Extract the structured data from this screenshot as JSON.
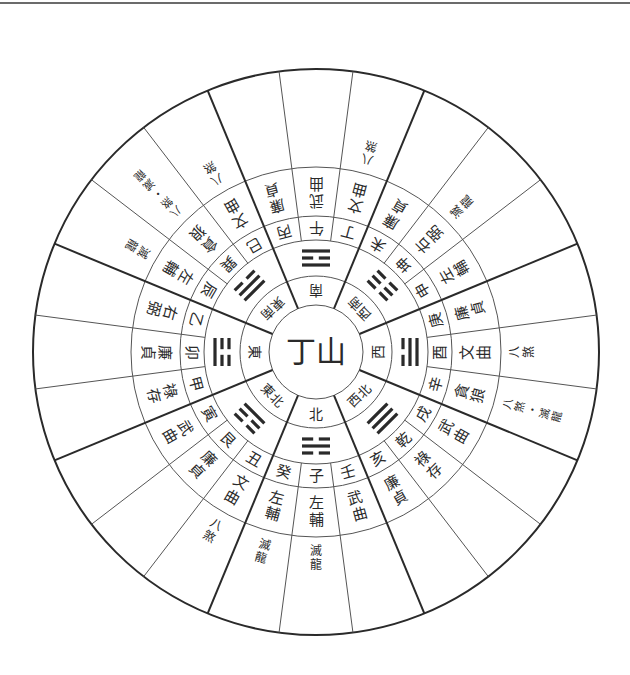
{
  "title": "丁山",
  "layout": {
    "cx": 316,
    "cy": 352,
    "radii": {
      "outer": 283,
      "star_outer": 185,
      "mountain_outer": 136,
      "trigram_outer": 112,
      "direction_outer": 76,
      "center": 47
    }
  },
  "center_label": "丁山",
  "directions": [
    {
      "name": "南",
      "trigram": "離",
      "lines": [
        1,
        0,
        1
      ]
    },
    {
      "name": "西南",
      "trigram": "坤",
      "lines": [
        0,
        0,
        0
      ]
    },
    {
      "name": "西",
      "trigram": "兌",
      "lines": [
        0,
        1,
        1
      ]
    },
    {
      "name": "西北",
      "trigram": "乾",
      "lines": [
        1,
        1,
        1
      ]
    },
    {
      "name": "北",
      "trigram": "坎",
      "lines": [
        0,
        1,
        0
      ]
    },
    {
      "name": "東北",
      "trigram": "艮",
      "lines": [
        1,
        0,
        0
      ]
    },
    {
      "name": "東",
      "trigram": "震",
      "lines": [
        0,
        0,
        1
      ]
    },
    {
      "name": "東南",
      "trigram": "巽",
      "lines": [
        1,
        1,
        0
      ]
    }
  ],
  "mountains": [
    {
      "mountain": "午",
      "star": "武曲",
      "outer": ""
    },
    {
      "mountain": "丁",
      "star": "文曲",
      "outer": "八煞"
    },
    {
      "mountain": "未",
      "star": "廉貞",
      "outer": ""
    },
    {
      "mountain": "坤",
      "star": "右弼",
      "outer": "滅龍"
    },
    {
      "mountain": "申",
      "star": "左輔",
      "outer": ""
    },
    {
      "mountain": "庚",
      "star": "廉貞",
      "outer": ""
    },
    {
      "mountain": "酉",
      "star": "文曲",
      "outer": "八煞"
    },
    {
      "mountain": "辛",
      "star": "貪狼",
      "outer": "八煞・滅龍"
    },
    {
      "mountain": "戌",
      "star": "武曲",
      "outer": ""
    },
    {
      "mountain": "乾",
      "star": "祿存",
      "outer": ""
    },
    {
      "mountain": "亥",
      "star": "廉貞",
      "outer": ""
    },
    {
      "mountain": "壬",
      "star": "武曲",
      "outer": ""
    },
    {
      "mountain": "子",
      "star": "左輔",
      "outer": "滅龍"
    },
    {
      "mountain": "癸",
      "star": "左輔",
      "outer": "滅龍"
    },
    {
      "mountain": "丑",
      "star": "文曲",
      "outer": "八煞"
    },
    {
      "mountain": "艮",
      "star": "廉貞",
      "outer": ""
    },
    {
      "mountain": "寅",
      "star": "武曲",
      "outer": ""
    },
    {
      "mountain": "甲",
      "star": "祿存",
      "outer": ""
    },
    {
      "mountain": "卯",
      "star": "廉貞",
      "outer": ""
    },
    {
      "mountain": "乙",
      "star": "右弼",
      "outer": ""
    },
    {
      "mountain": "辰",
      "star": "左輔",
      "outer": "滅龍"
    },
    {
      "mountain": "巽",
      "star": "貪狼",
      "outer": "八煞・滅龍"
    },
    {
      "mountain": "巳",
      "star": "文曲",
      "outer": "八煞"
    },
    {
      "mountain": "丙",
      "star": "廉貞",
      "outer": ""
    }
  ],
  "colors": {
    "line": "#2a2a2a",
    "thin_line": "#555555",
    "text": "#2a2a2a"
  }
}
